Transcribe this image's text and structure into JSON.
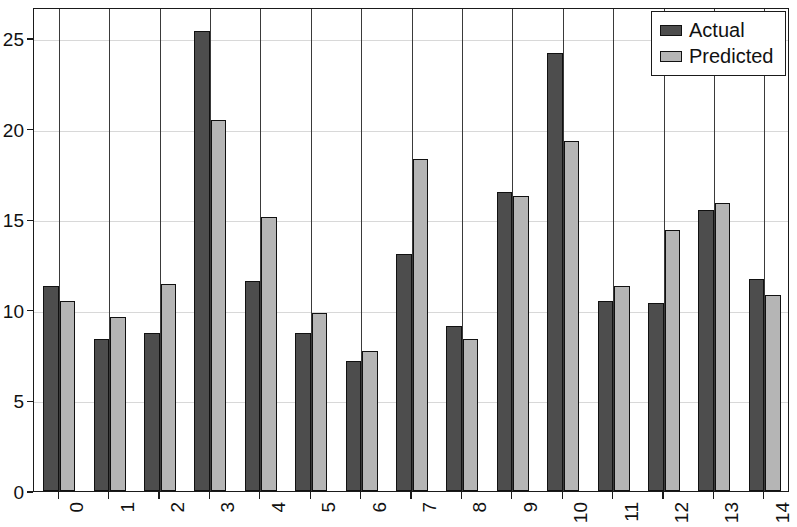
{
  "chart_data": {
    "type": "bar",
    "title": "",
    "subtitle": "",
    "xlabel": "",
    "ylabel": "",
    "categories": [
      "0",
      "1",
      "2",
      "3",
      "4",
      "5",
      "6",
      "7",
      "8",
      "9",
      "10",
      "11",
      "12",
      "13",
      "14"
    ],
    "series": [
      {
        "name": "Actual",
        "color": "#4d4d4d",
        "values": [
          11.3,
          8.4,
          8.7,
          25.4,
          11.6,
          8.7,
          7.2,
          13.1,
          9.1,
          16.5,
          24.2,
          10.5,
          10.4,
          15.5,
          11.7
        ]
      },
      {
        "name": "Predicted",
        "color": "#b5b5b5",
        "values": [
          10.5,
          9.6,
          11.4,
          20.5,
          15.1,
          9.8,
          7.7,
          18.3,
          8.4,
          16.3,
          19.3,
          11.3,
          14.4,
          15.9,
          10.8
        ]
      }
    ],
    "ylim": [
      0,
      26.8
    ],
    "yticks": [
      0,
      5,
      10,
      15,
      20,
      25
    ],
    "ytick_labels": [
      "0",
      "5",
      "10",
      "15",
      "20",
      "25"
    ],
    "grid": "horizontal",
    "xtick_rotation": 90,
    "legend": {
      "position": "top-right",
      "entries": [
        {
          "label": "Actual",
          "color": "#4d4d4d"
        },
        {
          "label": "Predicted",
          "color": "#b5b5b5"
        }
      ]
    },
    "axis_color": "#1a1a1a",
    "gridline_color": "#d8d8d8",
    "background": "#ffffff"
  }
}
